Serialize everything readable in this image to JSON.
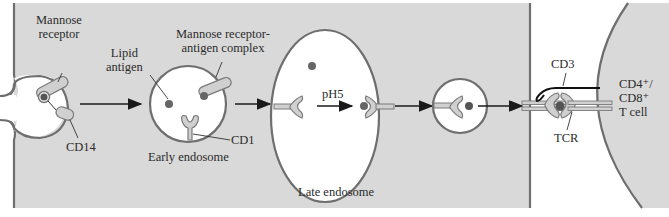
{
  "colors": {
    "cytoplasm": "#d9d9d9",
    "membrane": "#6e6e6e",
    "lumen": "#ffffff",
    "antigen": "#6a6a6a",
    "protein_fill": "#c8c8c8",
    "text": "#2b2b2b",
    "arrow": "#1a1a1a",
    "cd3": "#111111"
  },
  "labels": {
    "mannose_receptor": "Mannose\nreceptor",
    "cd14": "CD14",
    "lipid_antigen": "Lipid\nantigen",
    "mannose_receptor_complex": "Mannose receptor-\nantigen complex",
    "cd1": "CD1",
    "early_endosome": "Early endosome",
    "ph5": "pH5",
    "late_endosome": "Late endosome",
    "cd3": "CD3",
    "tcr": "TCR",
    "t_cell": "CD4⁺/\nCD8⁺\nT cell"
  },
  "stages": [
    "Uptake at cell surface",
    "Early endosome",
    "Late endosome (pH5 loading)",
    "Transport vesicle",
    "Presentation to T cell"
  ]
}
